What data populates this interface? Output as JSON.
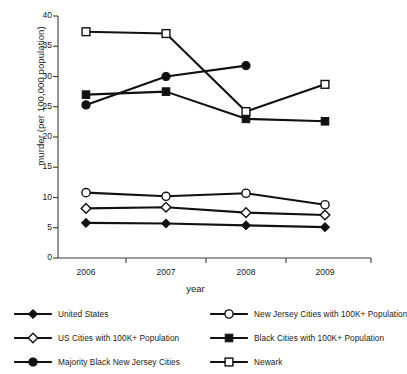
{
  "chart_data": {
    "type": "line",
    "title": "",
    "xlabel": "year",
    "ylabel": "murder (per 100,000 population)",
    "categories": [
      "2006",
      "2007",
      "2008",
      "2009"
    ],
    "x": [
      2006,
      2007,
      2008,
      2009
    ],
    "ylim": [
      0,
      40
    ],
    "yticks": [
      0,
      5,
      10,
      15,
      20,
      25,
      30,
      35,
      40
    ],
    "grid": false,
    "legend_position": "below-plot",
    "series": [
      {
        "name": "United States",
        "marker": "filled-diamond",
        "values": [
          5.8,
          5.7,
          5.4,
          5.1
        ]
      },
      {
        "name": "New Jersey Cities with 100K+ Population",
        "marker": "open-circle",
        "values": [
          10.8,
          10.2,
          10.7,
          8.8
        ]
      },
      {
        "name": "US Cities with 100K+ Population",
        "marker": "open-diamond",
        "values": [
          8.2,
          8.4,
          7.5,
          7.1
        ]
      },
      {
        "name": "Black Cities with 100K+ Population",
        "marker": "filled-square",
        "values": [
          27.0,
          27.5,
          23.0,
          22.6
        ]
      },
      {
        "name": "Majority Black New Jersey Cities",
        "marker": "filled-circle",
        "values": [
          25.3,
          30.0,
          31.8,
          null
        ]
      },
      {
        "name": "Newark",
        "marker": "open-square",
        "values": [
          37.4,
          37.1,
          24.2,
          28.7
        ]
      }
    ]
  },
  "axis": {
    "ytick_labels": [
      "40",
      "35",
      "30",
      "25",
      "20",
      "15",
      "10",
      "5",
      "0"
    ],
    "xtick_labels": [
      "2006",
      "2007",
      "2008",
      "2009"
    ],
    "ylabel": "murder (per 100,000 population)",
    "xlabel": "year"
  },
  "legend": {
    "items": [
      {
        "label": "United States",
        "marker": "filled-diamond"
      },
      {
        "label": "New Jersey Cities with 100K+ Population",
        "marker": "open-circle"
      },
      {
        "label": "US Cities with 100K+ Population",
        "marker": "open-diamond"
      },
      {
        "label": "Black Cities with 100K+ Population",
        "marker": "filled-square"
      },
      {
        "label": "Majority Black New Jersey Cities",
        "marker": "filled-circle"
      },
      {
        "label": "Newark",
        "marker": "open-square"
      }
    ]
  },
  "colors": {
    "line": "#111111",
    "marker_fill_open": "#ffffff",
    "marker_fill_solid": "#111111",
    "axis": "#3a3a3a",
    "text": "#1a1a1a",
    "background": "#ffffff"
  }
}
